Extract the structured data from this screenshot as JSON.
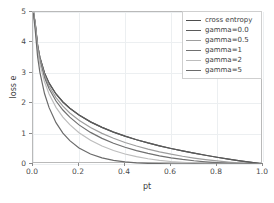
{
  "chart_data": {
    "type": "line",
    "title": "",
    "xlabel": "pt",
    "ylabel": "loss e",
    "xlim": [
      0.0,
      1.0
    ],
    "ylim": [
      0,
      5
    ],
    "grid": true,
    "legend_position": "upper right",
    "xticks": [
      "0.0",
      "0.2",
      "0.4",
      "0.6",
      "0.8",
      "1.0"
    ],
    "xtick_values": [
      0.0,
      0.2,
      0.4,
      0.6,
      0.8,
      1.0
    ],
    "yticks": [
      "0",
      "1",
      "2",
      "3",
      "4",
      "5"
    ],
    "ytick_values": [
      0,
      1,
      2,
      3,
      4,
      5
    ],
    "x": [
      0.002,
      0.01,
      0.02,
      0.03,
      0.05,
      0.07,
      0.1,
      0.13,
      0.16,
      0.2,
      0.25,
      0.3,
      0.35,
      0.4,
      0.45,
      0.5,
      0.55,
      0.6,
      0.65,
      0.7,
      0.75,
      0.8,
      0.85,
      0.9,
      0.95,
      1.0
    ],
    "series": [
      {
        "name": "cross entropy",
        "color": "#4d4d4d",
        "values": [
          5.0,
          4.605,
          3.912,
          3.507,
          2.996,
          2.659,
          2.303,
          2.04,
          1.833,
          1.609,
          1.386,
          1.204,
          1.05,
          0.916,
          0.799,
          0.693,
          0.598,
          0.511,
          0.431,
          0.357,
          0.288,
          0.223,
          0.163,
          0.105,
          0.051,
          0.0
        ]
      },
      {
        "name": "gamma=0.0",
        "color": "#5a5a5a",
        "values": [
          5.0,
          4.605,
          3.912,
          3.507,
          2.996,
          2.659,
          2.303,
          2.04,
          1.833,
          1.609,
          1.386,
          1.204,
          1.05,
          0.916,
          0.799,
          0.693,
          0.598,
          0.511,
          0.431,
          0.357,
          0.288,
          0.223,
          0.163,
          0.105,
          0.051,
          0.0
        ]
      },
      {
        "name": "gamma=0.5",
        "color": "#9e9e9e",
        "values": [
          4.995,
          4.582,
          3.873,
          3.455,
          2.92,
          2.565,
          2.185,
          1.904,
          1.679,
          1.439,
          1.2,
          1.007,
          0.847,
          0.709,
          0.593,
          0.49,
          0.401,
          0.323,
          0.255,
          0.196,
          0.144,
          0.1,
          0.063,
          0.033,
          0.011,
          0.0
        ]
      },
      {
        "name": "gamma=1",
        "color": "#707070",
        "values": [
          4.99,
          4.559,
          3.834,
          3.402,
          2.846,
          2.473,
          2.072,
          1.775,
          1.54,
          1.287,
          1.04,
          0.843,
          0.682,
          0.55,
          0.439,
          0.347,
          0.269,
          0.204,
          0.151,
          0.107,
          0.072,
          0.045,
          0.024,
          0.011,
          0.003,
          0.0
        ]
      },
      {
        "name": "gamma=2",
        "color": "#bdbdbd",
        "values": [
          4.98,
          4.513,
          3.757,
          3.301,
          2.704,
          2.3,
          1.864,
          1.544,
          1.294,
          1.03,
          0.78,
          0.59,
          0.444,
          0.33,
          0.242,
          0.173,
          0.121,
          0.082,
          0.053,
          0.032,
          0.018,
          0.009,
          0.004,
          0.001,
          0.0,
          0.0
        ]
      },
      {
        "name": "gamma=5",
        "color": "#6b6b6b",
        "values": [
          4.951,
          4.377,
          3.534,
          3.016,
          2.318,
          1.854,
          1.36,
          1.016,
          0.767,
          0.527,
          0.329,
          0.202,
          0.122,
          0.071,
          0.04,
          0.022,
          0.011,
          0.005,
          0.002,
          0.001,
          0.0,
          0.0,
          0.0,
          0.0,
          0.0,
          0.0
        ]
      }
    ]
  }
}
